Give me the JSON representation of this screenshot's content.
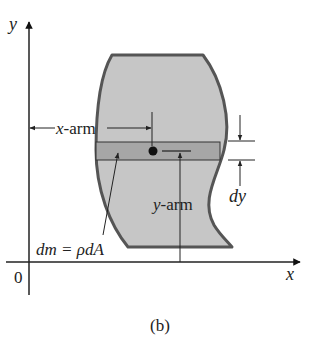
{
  "figure": {
    "caption": "(b)",
    "axes": {
      "x_label": "x",
      "y_label": "y",
      "origin_label": "0"
    },
    "labels": {
      "x_arm": "x-arm",
      "x_arm_var": "x",
      "x_arm_suffix": "-arm",
      "y_arm_var": "y",
      "y_arm_suffix": "-arm",
      "dy": "dy",
      "dm_equation": "dm = ρdA",
      "dm_var": "dm",
      "eq_sign": " = ",
      "rho_dA": "ρdA"
    },
    "colors": {
      "region_fill": "#c6c6c6",
      "strip_fill": "#a8a8a8",
      "outline": "#555555",
      "line": "#222222"
    }
  }
}
